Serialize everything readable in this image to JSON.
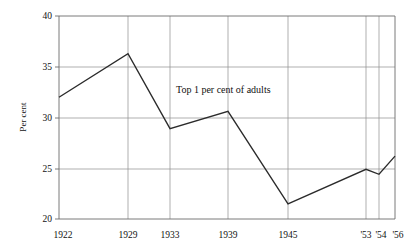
{
  "chart_data": {
    "type": "line",
    "title": "",
    "annotation": "Top 1 per cent of adults",
    "xlabel": "",
    "ylabel": "Per cent",
    "ylim": [
      20,
      40
    ],
    "yticks": [
      20,
      25,
      30,
      35,
      40
    ],
    "ytick_labels": [
      "20",
      "25",
      "30",
      "35",
      "40"
    ],
    "grid": true,
    "legend": "none",
    "categories": [
      "1922",
      "1929",
      "1933",
      "1939",
      "1945",
      "'53",
      "'54",
      "'56"
    ],
    "xtick_labels": [
      "1922",
      "1929",
      "1933",
      "1939",
      "1945",
      "'53",
      "'54",
      "'56"
    ],
    "values": [
      32.0,
      36.3,
      28.9,
      30.6,
      21.5,
      24.9,
      24.4,
      26.2
    ],
    "series": [
      {
        "name": "Top 1 per cent of adults",
        "x": [
          "1922",
          "1929",
          "1933",
          "1939",
          "1945",
          "'53",
          "'54",
          "'56"
        ],
        "values": [
          32.0,
          36.3,
          28.9,
          30.6,
          21.5,
          24.9,
          24.4,
          26.2
        ]
      }
    ],
    "x_positions_px": [
      59,
      128,
      170,
      228,
      288,
      366,
      379,
      395
    ],
    "colors": {
      "line": "#2b2b2b",
      "grid": "#8c8c8c",
      "frame": "#6b6b6b",
      "text": "#111111",
      "background": "#ffffff"
    }
  }
}
